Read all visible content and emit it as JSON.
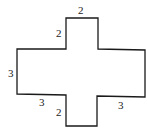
{
  "diagram": {
    "title": "",
    "shape": "cross-shaped polygon",
    "stroke_color": "#1a1a1a",
    "labels": {
      "top_width": "2",
      "top_arm_height": "2",
      "left_height": "3",
      "bottom_left_length": "3",
      "bottom_arm_height": "2",
      "bottom_right_length": "3"
    }
  }
}
